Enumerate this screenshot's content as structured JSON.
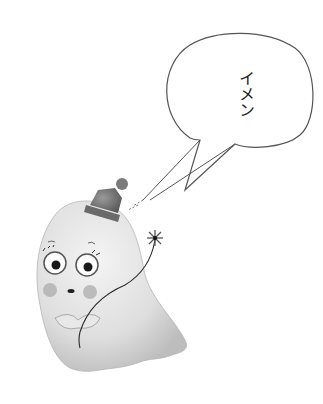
{
  "illustration": {
    "subject": "ghost with party hat holding flower on string",
    "background_color": "#ffffff",
    "ghost_color": "#e4e4e4",
    "ghost_shadow_color": "#c8c8c8",
    "hat_color": "#6e6e6e",
    "cheek_color": "#a8a8a8",
    "line_color": "#2a2a2a"
  },
  "speech_bubble": {
    "text": "イメン",
    "stroke_color": "#555555",
    "fill_color": "#ffffff"
  }
}
